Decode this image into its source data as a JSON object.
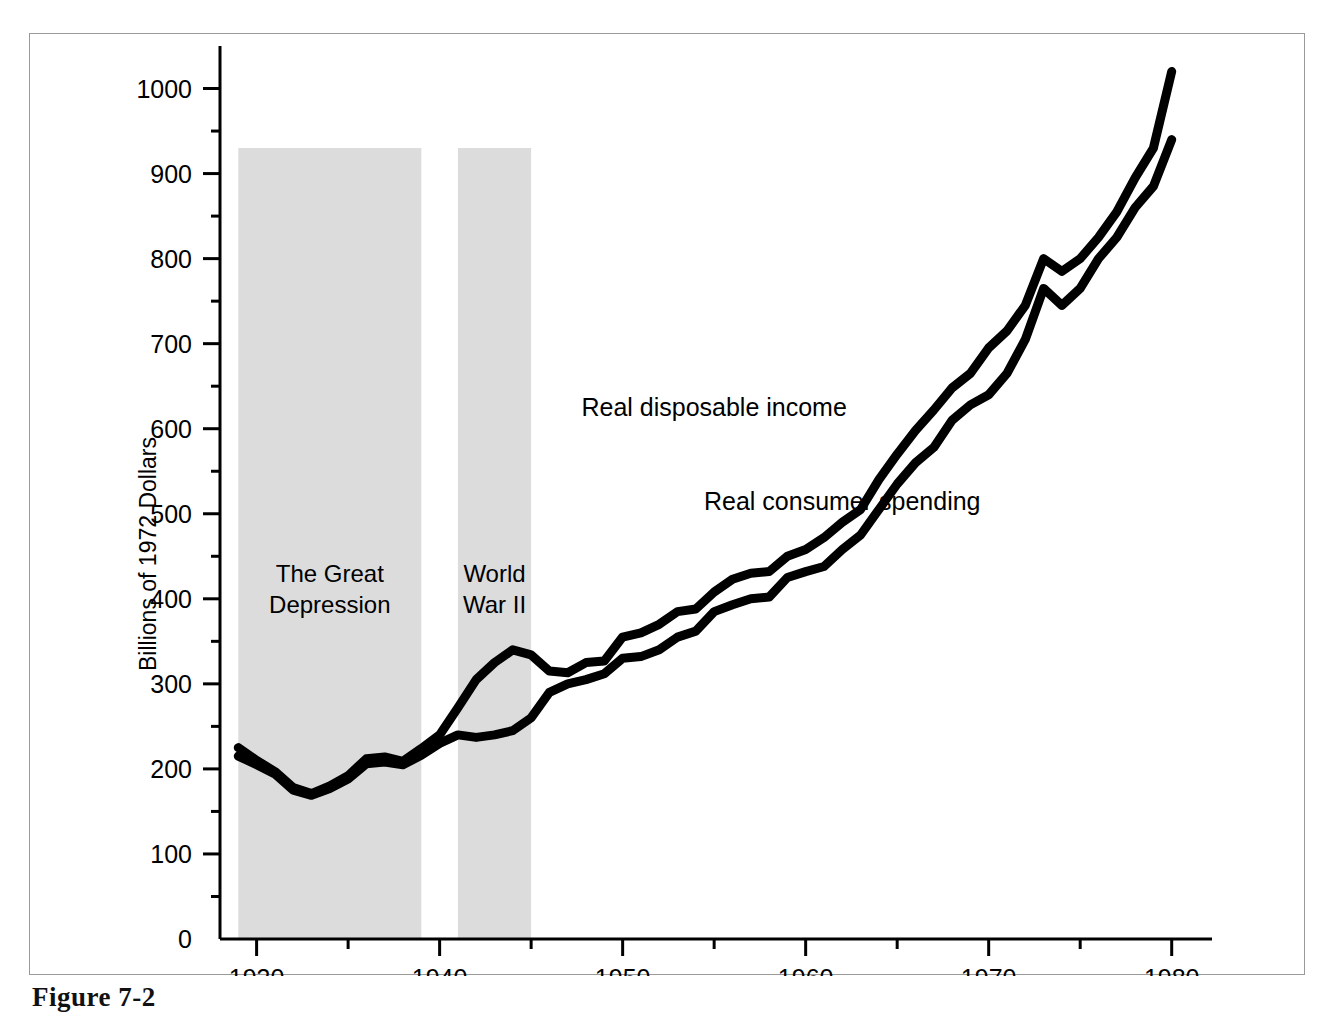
{
  "figure": {
    "caption": "Figure 7-2",
    "frame_color": "#9a9a9a",
    "background": "#ffffff"
  },
  "chart_data": {
    "type": "line",
    "title": "",
    "subtitle": "",
    "xlabel": "",
    "ylabel": "Billions of 1972 Dollars",
    "xlim": [
      1928,
      1981
    ],
    "ylim": [
      0,
      1050
    ],
    "grid": false,
    "legend_position": "inline-annotations",
    "line_color": "#000000",
    "line_width": 9,
    "x_ticks_major": [
      1930,
      1940,
      1950,
      1960,
      1970,
      1980
    ],
    "x_ticks_minor": [
      1935,
      1945,
      1955,
      1965,
      1975
    ],
    "x_tick_labels": [
      "1930",
      "1940",
      "1950",
      "1960",
      "1970",
      "1980"
    ],
    "y_ticks_major": [
      0,
      100,
      200,
      300,
      400,
      500,
      600,
      700,
      800,
      900,
      1000
    ],
    "y_tick_labels": [
      "0",
      "100",
      "200",
      "300",
      "400",
      "500",
      "600",
      "700",
      "800",
      "900",
      "1000"
    ],
    "y_ticks_minor": [
      50,
      150,
      250,
      350,
      450,
      550,
      650,
      750,
      850,
      950
    ],
    "x": [
      1929,
      1930,
      1931,
      1932,
      1933,
      1934,
      1935,
      1936,
      1937,
      1938,
      1939,
      1940,
      1941,
      1942,
      1943,
      1944,
      1945,
      1946,
      1947,
      1948,
      1949,
      1950,
      1951,
      1952,
      1953,
      1954,
      1955,
      1956,
      1957,
      1958,
      1959,
      1960,
      1961,
      1962,
      1963,
      1964,
      1965,
      1966,
      1967,
      1968,
      1969,
      1970,
      1971,
      1972,
      1973,
      1974,
      1975,
      1976,
      1977,
      1978,
      1979,
      1980
    ],
    "series": [
      {
        "name": "Real disposable income",
        "label": "Real disposable income",
        "values": [
          225,
          210,
          197,
          178,
          171,
          180,
          192,
          212,
          214,
          209,
          224,
          240,
          272,
          305,
          325,
          340,
          334,
          315,
          313,
          325,
          327,
          355,
          360,
          370,
          385,
          388,
          408,
          423,
          430,
          432,
          450,
          458,
          472,
          490,
          505,
          540,
          570,
          598,
          622,
          648,
          665,
          695,
          715,
          745,
          800,
          785,
          800,
          825,
          855,
          895,
          930,
          1020
        ]
      },
      {
        "name": "Real consumer spending",
        "label": "Real consumer spending",
        "values": [
          215,
          205,
          194,
          175,
          169,
          177,
          188,
          206,
          208,
          205,
          216,
          230,
          240,
          237,
          240,
          245,
          260,
          290,
          300,
          305,
          312,
          330,
          332,
          340,
          355,
          362,
          385,
          393,
          400,
          402,
          425,
          432,
          438,
          458,
          475,
          505,
          535,
          560,
          578,
          610,
          628,
          640,
          665,
          705,
          765,
          745,
          765,
          800,
          825,
          860,
          885,
          940
        ]
      }
    ],
    "shaded_bands": [
      {
        "label": "The Great Depression",
        "label_lines": [
          "The Great",
          "Depression"
        ],
        "x_start": 1929,
        "x_end": 1939,
        "y_top": 930,
        "color": "#dcdcdc"
      },
      {
        "label": "World War II",
        "label_lines": [
          "World",
          "War II"
        ],
        "x_start": 1941,
        "x_end": 1945,
        "y_top": 930,
        "color": "#dcdcdc"
      }
    ],
    "annotations": [
      {
        "text": "Real disposable income",
        "x": 1955,
        "y": 615
      },
      {
        "text": "Real consumer spending",
        "x": 1962,
        "y": 505
      }
    ]
  }
}
